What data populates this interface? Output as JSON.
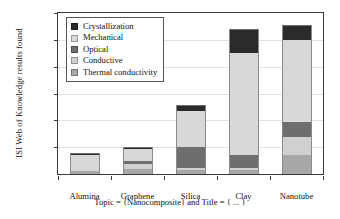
{
  "chart_data": {
    "type": "bar",
    "subtype": "stacked-bar",
    "title": "",
    "xlabel": "Topic = {Nanocomposite} and Title = { ... }",
    "ylabel": "ISI Web of Knowledge results found",
    "categories": [
      "Alumina",
      "Graphene",
      "Silica",
      "Clay",
      "Nanotube"
    ],
    "ylim": [
      0,
      1200
    ],
    "yticks": [
      0,
      200,
      400,
      600,
      800,
      1000,
      1200
    ],
    "ytick_labels": [
      "",
      "200",
      "400",
      "600",
      "800",
      "1000",
      "1200"
    ],
    "grid": true,
    "legend_position": "top-left-inside",
    "stack_order_bottom_to_top": [
      "Thermal conductivity",
      "Conductive",
      "Optical",
      "Mechanical",
      "Crystallization"
    ],
    "series": [
      {
        "name": "Crystallization",
        "color": "#2b2b2b",
        "values": [
          12,
          10,
          40,
          170,
          100
        ]
      },
      {
        "name": "Mechanical",
        "color": "#d8d8d8",
        "values": [
          115,
          85,
          265,
          755,
          610
        ]
      },
      {
        "name": "Optical",
        "color": "#6e6e6e",
        "values": [
          0,
          25,
          160,
          100,
          115
        ]
      },
      {
        "name": "Conductive",
        "color": "#d0d0d0",
        "values": [
          0,
          35,
          15,
          15,
          130
        ]
      },
      {
        "name": "Thermal conductivity",
        "color": "#a8a8a8",
        "values": [
          25,
          40,
          30,
          30,
          145
        ]
      }
    ],
    "totals": [
      152,
      195,
      510,
      1070,
      1100
    ]
  },
  "legend": {
    "items": [
      {
        "label": "Crystallization"
      },
      {
        "label": "Mechanical"
      },
      {
        "label": "Optical"
      },
      {
        "label": "Conductive"
      },
      {
        "label": "Thermal conductivity"
      }
    ]
  }
}
